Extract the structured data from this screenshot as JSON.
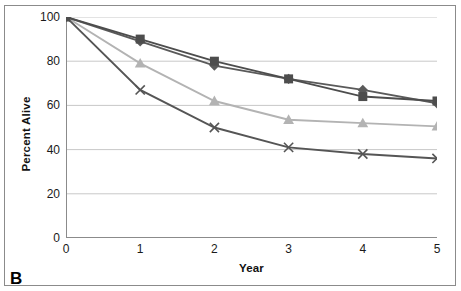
{
  "panel": {
    "label": "B"
  },
  "chart_data": {
    "type": "line",
    "title": "",
    "xlabel": "Year",
    "ylabel": "Percent Alive",
    "x": [
      0,
      1,
      2,
      3,
      4,
      5
    ],
    "xtick_labels": [
      "0",
      "1",
      "2",
      "3",
      "4",
      "5"
    ],
    "ytick_labels": [
      "0",
      "20",
      "40",
      "60",
      "80",
      "100"
    ],
    "yticks": [
      0,
      20,
      40,
      60,
      80,
      100
    ],
    "xlim": [
      0,
      5
    ],
    "ylim": [
      0,
      100
    ],
    "grid": "horizontal",
    "legend": "none",
    "series": [
      {
        "name": "series-square",
        "marker": "square",
        "color": "#4d4d4d",
        "line_color": "#4d4d4d",
        "values": [
          100,
          90,
          80,
          72,
          64,
          62
        ]
      },
      {
        "name": "series-diamond",
        "marker": "diamond",
        "color": "#5a5a5a",
        "line_color": "#5a5a5a",
        "values": [
          100,
          89,
          78,
          72,
          67,
          61
        ]
      },
      {
        "name": "series-triangle",
        "marker": "triangle",
        "color": "#b3b3b3",
        "line_color": "#b3b3b3",
        "values": [
          100,
          79,
          62,
          53.5,
          52,
          50.5
        ]
      },
      {
        "name": "series-cross",
        "marker": "x",
        "color": "#555555",
        "line_color": "#555555",
        "values": [
          100,
          67,
          50,
          41,
          38,
          36
        ]
      }
    ],
    "colors": {
      "gridline": "#c8c8c8",
      "axis": "#8b8b8b",
      "text": "#1a1a1a",
      "frame": "#8b8b8b",
      "background": "#ffffff"
    }
  }
}
